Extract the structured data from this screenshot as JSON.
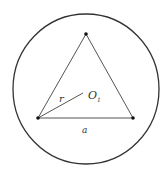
{
  "diagram": {
    "circle": {
      "cx": 86,
      "cy": 89,
      "rx": 73,
      "ry": 75,
      "stroke": "#333333"
    },
    "triangle": {
      "vertices": [
        [
          86,
          34
        ],
        [
          38,
          118
        ],
        [
          133,
          118
        ]
      ],
      "stroke": "#555555"
    },
    "radius_segment": {
      "from": [
        38,
        118
      ],
      "to": [
        83,
        93
      ]
    },
    "labels": {
      "radius": "r",
      "center": "O",
      "center_subscript": "1",
      "side": "a"
    }
  }
}
